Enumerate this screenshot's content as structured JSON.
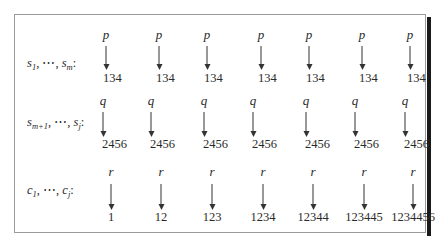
{
  "figure": {
    "rows": [
      {
        "label": {
          "base": "s",
          "first_sub": "1",
          "last_sub": "m"
        },
        "label_text": "s1, ⋯, sm:",
        "symbol": "p",
        "values": [
          "134",
          "134",
          "134",
          "134",
          "134",
          "134",
          "134"
        ],
        "arrow_x": [
          106,
          159,
          207,
          261,
          309,
          362,
          410
        ],
        "num_align": "left-offset"
      },
      {
        "label": {
          "base": "s",
          "first_sub": "m+1",
          "last_sub": "j"
        },
        "label_text": "sm+1, ⋯, sj:",
        "symbol": "q",
        "values": [
          "2456",
          "2456",
          "2456",
          "2456",
          "2456",
          "2456",
          "2456"
        ],
        "arrow_x": [
          103,
          151,
          204,
          253,
          306,
          355,
          405
        ],
        "num_align": "start"
      },
      {
        "label": {
          "base": "c",
          "first_sub": "1",
          "last_sub": "j"
        },
        "label_text": "c1, ⋯, cj:",
        "symbol": "r",
        "values": [
          "1",
          "12",
          "123",
          "1234",
          "12344",
          "123445",
          "1234456"
        ],
        "arrow_x": [
          111,
          161,
          212,
          263,
          313,
          364,
          413
        ],
        "num_align": "center"
      }
    ],
    "separator": ",",
    "ellipsis": "⋯",
    "colon": ":"
  },
  "colors": {
    "border": "#9a9a9a",
    "shadow": "#1a1a1a",
    "text": "#2a2a2a",
    "arrow": "#333333"
  }
}
